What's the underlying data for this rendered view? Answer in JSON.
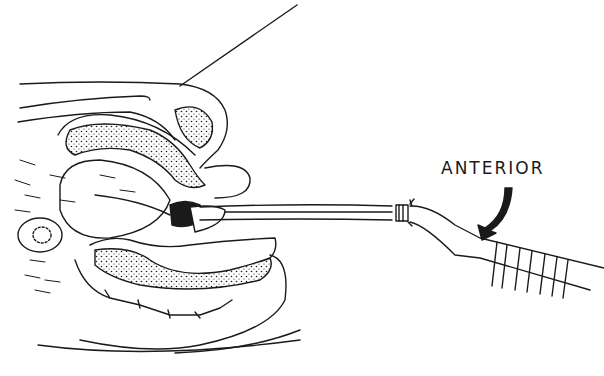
{
  "figure": {
    "type": "line-art anatomical illustration",
    "label": "ANTERIOR",
    "colors": {
      "ink": "#1a1a1a",
      "background": "#ffffff"
    }
  }
}
